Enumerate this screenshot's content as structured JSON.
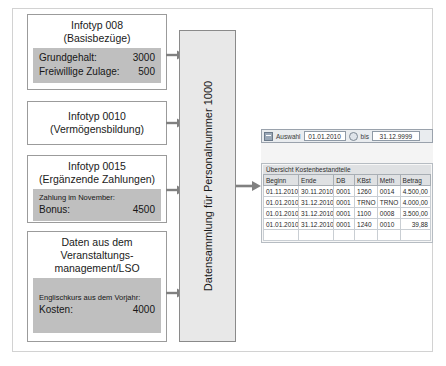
{
  "diagram": {
    "center_bar_label": "Datensammlung für Personalnummer 1000",
    "boxes": [
      {
        "id": "box-008",
        "title": "Infotyp 008\n(Basisbezüge)",
        "note": "",
        "rows": [
          {
            "label": "Grundgehalt:",
            "value": "3000"
          },
          {
            "label": "Freiwillige Zulage:",
            "value": "500"
          }
        ]
      },
      {
        "id": "box-0010",
        "title": "Infotyp 0010\n(Vermögensbildung)",
        "note": "",
        "rows": []
      },
      {
        "id": "box-0015",
        "title": "Infotyp 0015\n(Ergänzende Zahlungen)",
        "note": "Zahlung im November:",
        "rows": [
          {
            "label": "Bonus:",
            "value": "4500"
          }
        ]
      },
      {
        "id": "box-lso",
        "title": "Daten aus dem\nVeranstaltungs-\nmanagement/LSO",
        "note": "Englischkurs aus dem Vorjahr:",
        "rows": [
          {
            "label": "Kosten:",
            "value": "4000"
          }
        ]
      }
    ]
  },
  "sap": {
    "toolbar": {
      "icon": "selection-icon",
      "label": "Auswahl",
      "date_from": "01.01.2010",
      "date_to": "31.12.9999",
      "bis_label": "bis",
      "matchcode_icon": "matchcode-icon"
    },
    "table": {
      "title": "Übersicht Kostenbestandteile",
      "columns": [
        "Beginn",
        "Ende",
        "DB",
        "KBst",
        "Meth",
        "Betrag"
      ],
      "rows": [
        [
          "01.11.2010",
          "30.11.2010",
          "0001",
          "1260",
          "0014",
          "4.500,00"
        ],
        [
          "01.01.2010",
          "31.12.2010",
          "0001",
          "TRNO",
          "TRNO",
          "4.000,00"
        ],
        [
          "01.01.2010",
          "31.12.2010",
          "0001",
          "1100",
          "0008",
          "3.500,00"
        ],
        [
          "01.01.2010",
          "31.12.2010",
          "0001",
          "1240",
          "0010",
          "39,88"
        ]
      ]
    }
  },
  "colors": {
    "box_body": "#bfbfbf",
    "bar_fill": "#e8e8e8",
    "arrow": "#808080",
    "frame": "#d2d2d2"
  }
}
